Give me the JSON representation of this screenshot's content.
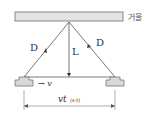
{
  "diagram": {
    "mirror_label": "거울",
    "left_path_label": "D",
    "right_path_label": "D",
    "height_label": "L",
    "velocity_label": "→ v",
    "distance_label": "vt",
    "distance_sub": "(s-t)"
  },
  "colors": {
    "mirror_fill": "#e4e4e4",
    "mirror_stroke": "#888888",
    "block_fill": "#d8d8d8",
    "line": "#444444"
  }
}
